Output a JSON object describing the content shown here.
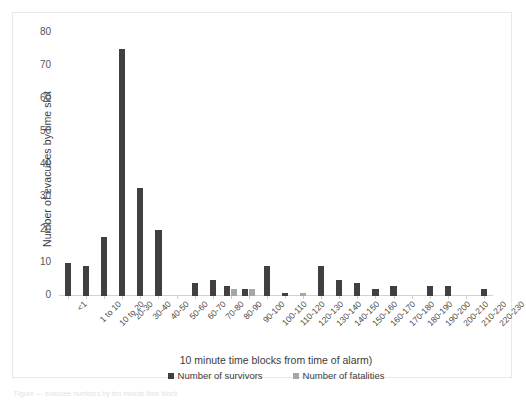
{
  "chart_data": {
    "type": "bar",
    "title": "",
    "xlabel": "10 minute time blocks from time of alarm)",
    "ylabel": "Number of evacuees by time slot",
    "ylim": [
      0,
      80
    ],
    "ytick_values": [
      80,
      70,
      60,
      50,
      40,
      30,
      20,
      10,
      0
    ],
    "ytick_labels": [
      "80",
      "70",
      "60",
      "50",
      "40",
      "30",
      "20",
      "10",
      "0"
    ],
    "grid": false,
    "legend_position": "bottom-center",
    "categories": [
      "<1",
      "1 to 10",
      "10 to 20",
      "20-30",
      "30-40",
      "40-50",
      "50-60",
      "60-70",
      "70-80",
      "80-90",
      "90-100",
      "100-110",
      "110-120",
      "120-130",
      "130-140",
      "140-150",
      "150-160",
      "160-170",
      "170-180",
      "180-190",
      "190-200",
      "200-210",
      "210-220",
      "220-230"
    ],
    "series": [
      {
        "name": "Number of survivors",
        "color": "#404040",
        "values": [
          10,
          9,
          18,
          75,
          33,
          20,
          0,
          4,
          5,
          3,
          2,
          9,
          1,
          0,
          9,
          5,
          4,
          2,
          3,
          0,
          3,
          3,
          0,
          2
        ]
      },
      {
        "name": "Number of fatalities",
        "color": "#a6a6a6",
        "values": [
          0,
          0,
          0,
          0,
          0,
          0,
          0,
          0,
          0,
          2,
          2,
          0,
          0,
          1,
          0,
          0,
          0,
          0,
          0,
          0,
          0,
          0,
          0,
          0
        ]
      }
    ]
  },
  "caption": {
    "sliver_text": "Figure — evacuee numbers by ten minute time block"
  }
}
